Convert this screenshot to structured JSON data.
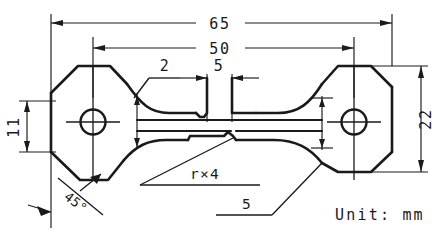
{
  "drawing": {
    "title": "Tensile test specimen",
    "unit_note": "Unit: mm",
    "dimensions": {
      "overall_length": "65",
      "gauge_span": "50",
      "left_height": "11",
      "right_height": "22",
      "shoulder_offset": "2",
      "notch_width": "5",
      "fillet_note": "r×4",
      "bottom_notch": "5",
      "chamfer_angle": "45°"
    },
    "labels": {
      "d65": "65",
      "d50": "50",
      "d11": "11",
      "d22": "22",
      "d2": "2",
      "d5_top": "5",
      "d5_bottom": "5",
      "radius": "r×4",
      "angle": "45°",
      "unit": "Unit: mm"
    },
    "colors": {
      "ink": "#1a1a1a",
      "background": "#ffffff"
    },
    "features": {
      "left_grip": "octagonal-grip-with-hole",
      "right_grip": "octagonal-grip-with-hole",
      "hole_count": 2,
      "waist": "necked-gauge-section-with-notch"
    }
  }
}
